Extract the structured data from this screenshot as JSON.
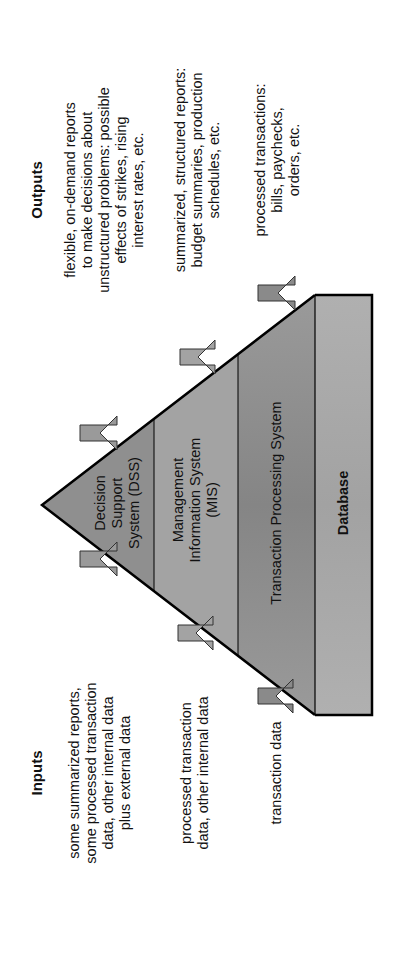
{
  "diagram": {
    "type": "pyramid",
    "orientation": "rotated -90deg",
    "colors": {
      "dss_fill": "#8f8f8f",
      "mis_fill": "#a3a3a3",
      "tps_fill": "#8c8c8c",
      "database_fill": "#a9a9a9",
      "arrow_fill": "#9a9a9a",
      "arrow_dark_fill": "#8a8a8a",
      "outline": "#000000"
    },
    "inputs": {
      "heading": "Inputs",
      "items": [
        {
          "level": "DSS",
          "text_lines": [
            "some summarized reports,",
            "some processed transaction",
            "data, other internal data",
            "plus external data"
          ]
        },
        {
          "level": "MIS",
          "text_lines": [
            "processed transaction",
            "data, other internal data"
          ]
        },
        {
          "level": "TPS",
          "text_lines": [
            "transaction data"
          ]
        }
      ]
    },
    "outputs": {
      "heading": "Outputs",
      "items": [
        {
          "level": "DSS",
          "text_lines": [
            "flexible, on-demand reports",
            "to make decisions about",
            "unstructured problems: possible",
            "effects of strikes, rising",
            "interest rates, etc."
          ]
        },
        {
          "level": "MIS",
          "text_lines": [
            "summarized, structured reports:",
            "budget summaries, production",
            "schedules, etc."
          ]
        },
        {
          "level": "TPS",
          "text_lines": [
            "processed transactions:",
            "bills, paychecks,",
            "orders, etc."
          ]
        }
      ]
    },
    "layers": [
      {
        "id": "dss",
        "label_lines": [
          "Decision",
          "Support",
          "System (DSS)"
        ]
      },
      {
        "id": "mis",
        "label_lines": [
          "Management",
          "Information System",
          "(MIS)"
        ]
      },
      {
        "id": "tps",
        "label_lines": [
          "Transaction Processing System"
        ]
      },
      {
        "id": "database",
        "label_lines": [
          "Database"
        ]
      }
    ]
  }
}
